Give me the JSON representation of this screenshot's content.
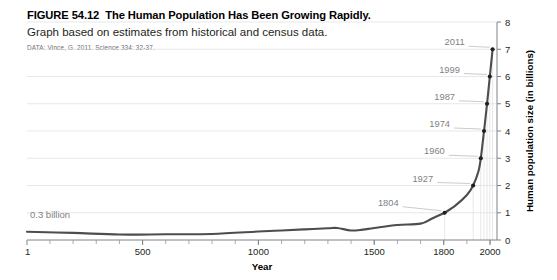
{
  "figure": {
    "number": "FIGURE 54.12",
    "title": "The Human Population Has Been Growing Rapidly.",
    "subtitle": "Graph based on estimates from historical and census data.",
    "source": "DATA: Vince, G. 2011. Science 334: 32-37."
  },
  "chart_data": {
    "type": "line",
    "title": "The Human Population Has Been Growing Rapidly.",
    "xlabel": "Year",
    "ylabel": "Human population size (in billions)",
    "xlim": [
      1,
      2030
    ],
    "ylim": [
      0,
      8
    ],
    "grid": true,
    "legend": "none",
    "x_ticks": [
      "1",
      "500",
      "1000",
      "1500",
      "1800",
      "2000"
    ],
    "x_tick_values": [
      1,
      500,
      1000,
      1500,
      1800,
      2000
    ],
    "x_minor_step": 100,
    "y_ticks": [
      "0",
      "1",
      "2",
      "3",
      "4",
      "5",
      "6",
      "7",
      "8"
    ],
    "y_tick_values": [
      0,
      1,
      2,
      3,
      4,
      5,
      6,
      7,
      8
    ],
    "series": [
      {
        "name": "Human population",
        "x": [
          1,
          200,
          400,
          600,
          800,
          1000,
          1100,
          1200,
          1300,
          1340,
          1400,
          1450,
          1500,
          1600,
          1700,
          1750,
          1800,
          1804,
          1850,
          1900,
          1927,
          1950,
          1960,
          1974,
          1987,
          1999,
          2011
        ],
        "y": [
          0.3,
          0.26,
          0.2,
          0.21,
          0.22,
          0.31,
          0.35,
          0.39,
          0.43,
          0.44,
          0.35,
          0.38,
          0.44,
          0.55,
          0.6,
          0.79,
          0.98,
          1.0,
          1.26,
          1.65,
          2.0,
          2.52,
          3.0,
          4.0,
          5.0,
          6.0,
          7.0
        ]
      }
    ],
    "milestones": [
      {
        "label": "1804",
        "year": 1804,
        "billions": 1
      },
      {
        "label": "1927",
        "year": 1927,
        "billions": 2
      },
      {
        "label": "1960",
        "year": 1960,
        "billions": 3
      },
      {
        "label": "1974",
        "year": 1974,
        "billions": 4
      },
      {
        "label": "1987",
        "year": 1987,
        "billions": 5
      },
      {
        "label": "1999",
        "year": 1999,
        "billions": 6
      },
      {
        "label": "2011",
        "year": 2011,
        "billions": 7
      }
    ],
    "annotations": [
      {
        "name": "start-value-callout",
        "text": "0.3 billion",
        "year": 1,
        "billions": 0.3
      }
    ],
    "colors": {
      "curve": "#4d4d4f",
      "axis": "#808285",
      "grid": "#d9d9d9",
      "annotation": "#808285",
      "text": "#231f20"
    }
  }
}
